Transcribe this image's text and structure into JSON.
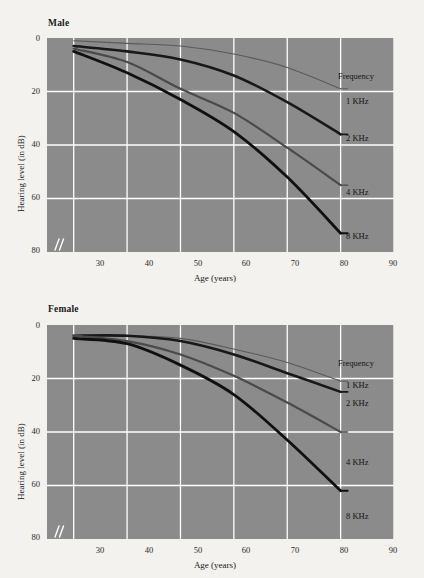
{
  "figure": {
    "background_color": "#f3f2ef",
    "plot_background_color": "#8b8b8b",
    "grid_color": "#ffffff"
  },
  "panels": [
    {
      "id": "male",
      "title": "Male",
      "axis_break_symbol": "//"
    },
    {
      "id": "female",
      "title": "Female",
      "axis_break_symbol": "//"
    }
  ],
  "labels": {
    "y_axis": "Hearing level (in dB)",
    "x_axis": "Age (years)",
    "legend_title": "Frequency"
  },
  "ticks": {
    "x": [
      "30",
      "40",
      "50",
      "60",
      "70",
      "80",
      "90"
    ],
    "y": [
      "0",
      "20",
      "40",
      "60",
      "80"
    ]
  },
  "legend": [
    {
      "label": "1 KHz",
      "color": "#5a5a5a"
    },
    {
      "label": "2 KHz",
      "color": "#181818"
    },
    {
      "label": "4 KHz",
      "color": "#4a4a4a"
    },
    {
      "label": "8 KHz",
      "color": "#101010"
    }
  ],
  "chart_data": [
    {
      "type": "line",
      "title": "Male",
      "xlabel": "Age (years)",
      "ylabel": "Hearing level (in dB)",
      "xlim": [
        25,
        90
      ],
      "ylim": [
        0,
        80
      ],
      "y_inverted": true,
      "grid": true,
      "legend_title": "Frequency",
      "legend_position": "right-inside",
      "x": [
        30,
        40,
        50,
        60,
        70,
        80
      ],
      "series": [
        {
          "name": "1 KHz",
          "color": "#5a5a5a",
          "width": 1.1,
          "values": [
            1,
            2,
            3,
            6,
            11,
            19
          ]
        },
        {
          "name": "2 KHz",
          "color": "#181818",
          "width": 2.6,
          "values": [
            3,
            5,
            8,
            14,
            24,
            36
          ]
        },
        {
          "name": "4 KHz",
          "color": "#4a4a4a",
          "width": 2.2,
          "values": [
            4,
            9,
            19,
            28,
            41,
            55
          ]
        },
        {
          "name": "8 KHz",
          "color": "#101010",
          "width": 2.8,
          "values": [
            5,
            13,
            23,
            35,
            52,
            73
          ]
        }
      ]
    },
    {
      "type": "line",
      "title": "Female",
      "xlabel": "Age (years)",
      "ylabel": "Hearing level (in dB)",
      "xlim": [
        25,
        90
      ],
      "ylim": [
        0,
        80
      ],
      "y_inverted": true,
      "grid": true,
      "legend_title": "Frequency",
      "legend_position": "right-inside",
      "x": [
        30,
        40,
        50,
        60,
        70,
        80
      ],
      "series": [
        {
          "name": "1 KHz",
          "color": "#5a5a5a",
          "width": 1.1,
          "values": [
            4,
            4,
            5,
            9,
            14,
            21
          ]
        },
        {
          "name": "2 KHz",
          "color": "#181818",
          "width": 2.6,
          "values": [
            4,
            4,
            6,
            11,
            18,
            25
          ]
        },
        {
          "name": "4 KHz",
          "color": "#4a4a4a",
          "width": 2.2,
          "values": [
            4,
            6,
            11,
            19,
            29,
            40
          ]
        },
        {
          "name": "8 KHz",
          "color": "#101010",
          "width": 2.8,
          "values": [
            5,
            7,
            15,
            26,
            43,
            62
          ]
        }
      ]
    }
  ]
}
